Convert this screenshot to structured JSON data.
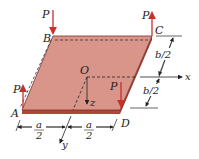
{
  "diagram": {
    "corners": {
      "A": "A",
      "B": "B",
      "C": "C",
      "D": "D"
    },
    "origin": "O",
    "axes": {
      "x": "x",
      "y": "y",
      "z": "z"
    },
    "loads": [
      {
        "corner": "B",
        "label": "P",
        "direction": "down"
      },
      {
        "corner": "C",
        "label": "P",
        "direction": "up"
      },
      {
        "corner": "A",
        "label": "P",
        "direction": "up"
      },
      {
        "corner": "D",
        "label": "P",
        "direction": "down"
      }
    ],
    "dimensions": {
      "a_half_left": {
        "num": "a",
        "den": "2"
      },
      "a_half_right": {
        "num": "a",
        "den": "2"
      },
      "b_half_top": "b/2",
      "b_half_bottom": "b/2"
    },
    "colors": {
      "plate_face": "#d9958a",
      "plate_edge": "#b0453a",
      "load_arrow": "#c8302a",
      "line": "#222222"
    }
  }
}
